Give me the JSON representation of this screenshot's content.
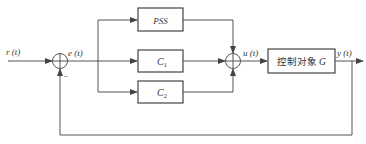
{
  "diagram": {
    "type": "control-block-diagram",
    "signals": {
      "input": "r (t)",
      "error": "e (t)",
      "control": "u (t)",
      "output": "y (t)"
    },
    "blocks": [
      {
        "id": "pss",
        "label": "PSS"
      },
      {
        "id": "c1",
        "label": "C",
        "subscript": "1"
      },
      {
        "id": "c2",
        "label": "C",
        "subscript": "2"
      },
      {
        "id": "plant",
        "label": "控制对象",
        "symbol": "G"
      }
    ],
    "summing_junctions": [
      {
        "id": "sum1",
        "feedback_sign": "−"
      },
      {
        "id": "sum2"
      }
    ],
    "colors": {
      "line": "#555555",
      "text": "#333333"
    }
  }
}
